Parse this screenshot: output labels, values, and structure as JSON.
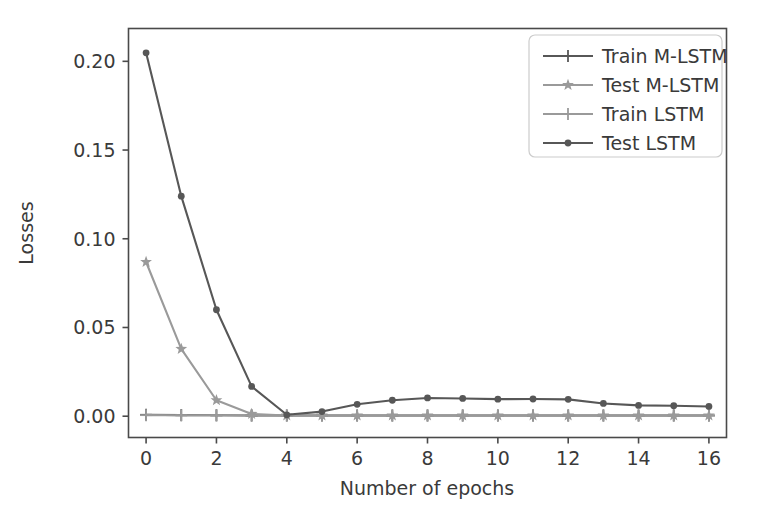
{
  "chart_data": {
    "type": "line",
    "title": "",
    "xlabel": "Number of epochs",
    "ylabel": "Losses",
    "xlim": [
      -0.5,
      16.5
    ],
    "ylim": [
      -0.012,
      0.2185
    ],
    "grid": false,
    "legend_position": "upper right",
    "xticks": [
      0,
      2,
      4,
      6,
      8,
      10,
      12,
      14,
      16
    ],
    "xticklabels": [
      "0",
      "2",
      "4",
      "6",
      "8",
      "10",
      "12",
      "14",
      "16"
    ],
    "yticks": [
      0.0,
      0.05,
      0.1,
      0.15,
      0.2
    ],
    "yticklabels": [
      "0.00",
      "0.05",
      "0.10",
      "0.15",
      "0.20"
    ],
    "x": [
      0,
      1,
      2,
      3,
      4,
      5,
      6,
      7,
      8,
      9,
      10,
      11,
      12,
      13,
      14,
      15,
      16
    ],
    "series": [
      {
        "name": "Train M-LSTM",
        "marker": "plus",
        "color": "#575757",
        "values": [
          0.0008,
          0.0006,
          0.0005,
          0.0004,
          0.0004,
          0.0004,
          0.0004,
          0.0004,
          0.0004,
          0.0004,
          0.0004,
          0.0004,
          0.0004,
          0.0004,
          0.0004,
          0.0004,
          0.0004
        ]
      },
      {
        "name": "Test M-LSTM",
        "marker": "star",
        "color": "#9a9a9a",
        "values": [
          0.0869,
          0.0379,
          0.009,
          0.0013,
          0.0004,
          0.0004,
          0.0004,
          0.0004,
          0.0004,
          0.0004,
          0.0004,
          0.0004,
          0.0004,
          0.0004,
          0.0004,
          0.0004,
          0.0004
        ]
      },
      {
        "name": "Train LSTM",
        "marker": "plus",
        "color": "#9a9a9a",
        "values": [
          0.0006,
          0.0005,
          0.0005,
          0.0004,
          0.0004,
          0.0004,
          0.0004,
          0.0004,
          0.0004,
          0.0004,
          0.0004,
          0.0004,
          0.0004,
          0.0004,
          0.0004,
          0.0004,
          0.0004
        ]
      },
      {
        "name": "Test LSTM",
        "marker": "circle",
        "color": "#575757",
        "values": [
          0.2048,
          0.124,
          0.06,
          0.0168,
          0.0008,
          0.0026,
          0.0067,
          0.009,
          0.0103,
          0.01,
          0.0096,
          0.0097,
          0.0095,
          0.0072,
          0.0061,
          0.0059,
          0.0055
        ]
      }
    ]
  },
  "axes": {
    "ylabel": "Losses",
    "xlabel": "Number of epochs"
  },
  "legend": {
    "entries": [
      {
        "label": "Train M-LSTM"
      },
      {
        "label": "Test M-LSTM"
      },
      {
        "label": "Train LSTM"
      },
      {
        "label": "Test LSTM"
      }
    ]
  },
  "style": {
    "background": "#ffffff",
    "frame_color": "#4a4a4a",
    "dark_gray": "#575757",
    "light_gray": "#9a9a9a",
    "text_color": "#3a3a3a"
  }
}
